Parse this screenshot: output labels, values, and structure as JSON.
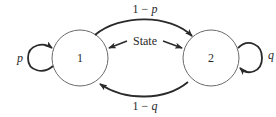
{
  "diagram": {
    "type": "markov-chain-state-diagram",
    "states": [
      {
        "id": "1",
        "label": "1"
      },
      {
        "id": "2",
        "label": "2"
      }
    ],
    "transitions": [
      {
        "from": "1",
        "to": "1",
        "label": "p"
      },
      {
        "from": "1",
        "to": "2",
        "label": "1 − p"
      },
      {
        "from": "2",
        "to": "1",
        "label": "1 − q"
      },
      {
        "from": "2",
        "to": "2",
        "label": "q"
      }
    ],
    "annotation": {
      "label": "State",
      "points_to": [
        "1",
        "2"
      ]
    },
    "colors": {
      "stroke": "#2a2a2a",
      "circle": "#6a6a6a",
      "background": "#ffffff"
    }
  }
}
